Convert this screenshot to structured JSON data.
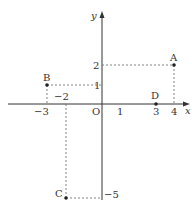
{
  "diagram": {
    "type": "coordinate-plane",
    "axes": {
      "x_label": "x",
      "y_label": "y",
      "origin_label": "O"
    },
    "ticks": {
      "x_neg3": "−3",
      "x_neg2": "−2",
      "x_1": "1",
      "x_3": "3",
      "x_4": "4",
      "y_2": "2",
      "y_1": "1",
      "y_neg5": "−5"
    },
    "points": [
      {
        "label": "A",
        "x": 4,
        "y": 2
      },
      {
        "label": "B",
        "x": -3,
        "y": 1
      },
      {
        "label": "C",
        "x": -2,
        "y": -5
      },
      {
        "label": "D",
        "x": 3,
        "y": 0
      }
    ],
    "colors": {
      "axis": "#333333",
      "dashed": "#666666",
      "point": "#222222"
    }
  }
}
